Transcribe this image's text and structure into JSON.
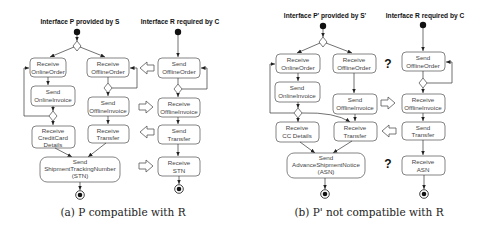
{
  "panel_a": {
    "caption": "(a) P compatible with R",
    "left_title": "Interface P provided by S",
    "right_title": "Interface R required by C",
    "left_nodes": {
      "receive_online_order": [
        "Receive",
        "OnlineOrder"
      ],
      "receive_offline_order": [
        "Receive",
        "OfflineOrder"
      ],
      "send_online_invoice": [
        "Send",
        "OnlineInvoice"
      ],
      "send_offline_invoice": [
        "Send",
        "OfflineInvoice"
      ],
      "receive_creditcard_details": [
        "Receive",
        "CreditCard",
        "Details"
      ],
      "receive_transfer": [
        "Receive",
        "Transfer"
      ],
      "send_stn": [
        "Send",
        "ShipmentTrackingNumber",
        "(STN)"
      ]
    },
    "right_nodes": {
      "send_offline_order": [
        "Send",
        "OfflineOrder"
      ],
      "receive_offline_invoice": [
        "Receive",
        "OfflineInvoice"
      ],
      "send_transfer": [
        "Send",
        "Transfer"
      ],
      "receive_stn": [
        "Receive",
        "STN"
      ]
    }
  },
  "panel_b": {
    "caption": "(b) P' not compatible with R",
    "left_title": "Interface P' provided by S'",
    "right_title": "Interface R required by C",
    "mismatch_marker": "?",
    "left_nodes": {
      "receive_online_order": [
        "Receive",
        "OnlineOrder"
      ],
      "receive_offline_order": [
        "Receive",
        "OfflineOrder"
      ],
      "send_online_invoice": [
        "Send",
        "OnlineInvoice"
      ],
      "send_offline_invoice": [
        "Send",
        "OfflineInvoice"
      ],
      "receive_cc_details": [
        "Receive",
        "CC Details"
      ],
      "receive_transfer": [
        "Receive",
        "Transfer"
      ],
      "send_asn": [
        "Send",
        "AdvanceShipmentNotice",
        "(ASN)"
      ]
    },
    "right_nodes": {
      "send_offline_order": [
        "Send",
        "OfflineOrder"
      ],
      "receive_offline_invoice": [
        "Receive",
        "OfflineInvoice"
      ],
      "send_transfer": [
        "Send",
        "Transfer"
      ],
      "receive_asn": [
        "Receive",
        "ASN"
      ]
    }
  }
}
